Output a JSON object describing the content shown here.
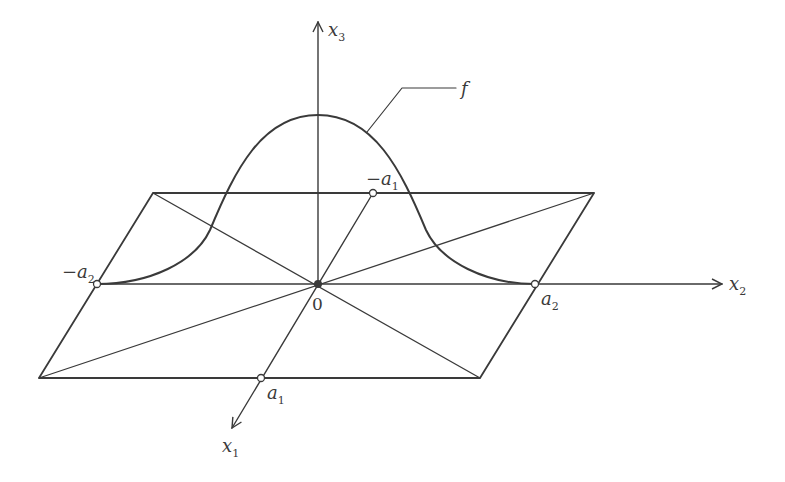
{
  "figure": {
    "colors": {
      "stroke": "#3a3a3a",
      "background": "#ffffff"
    },
    "axes": {
      "x1": {
        "label": "x",
        "subscript": "1"
      },
      "x2": {
        "label": "x",
        "subscript": "2"
      },
      "x3": {
        "label": "x",
        "subscript": "3"
      }
    },
    "points": {
      "origin": {
        "label": "0"
      },
      "a1": {
        "label": "a",
        "subscript": "1"
      },
      "neg_a1": {
        "label": "−a",
        "subscript": "1"
      },
      "a2": {
        "label": "a",
        "subscript": "2"
      },
      "neg_a2": {
        "label": "−a",
        "subscript": "2"
      }
    },
    "curve": {
      "label": "f"
    }
  }
}
